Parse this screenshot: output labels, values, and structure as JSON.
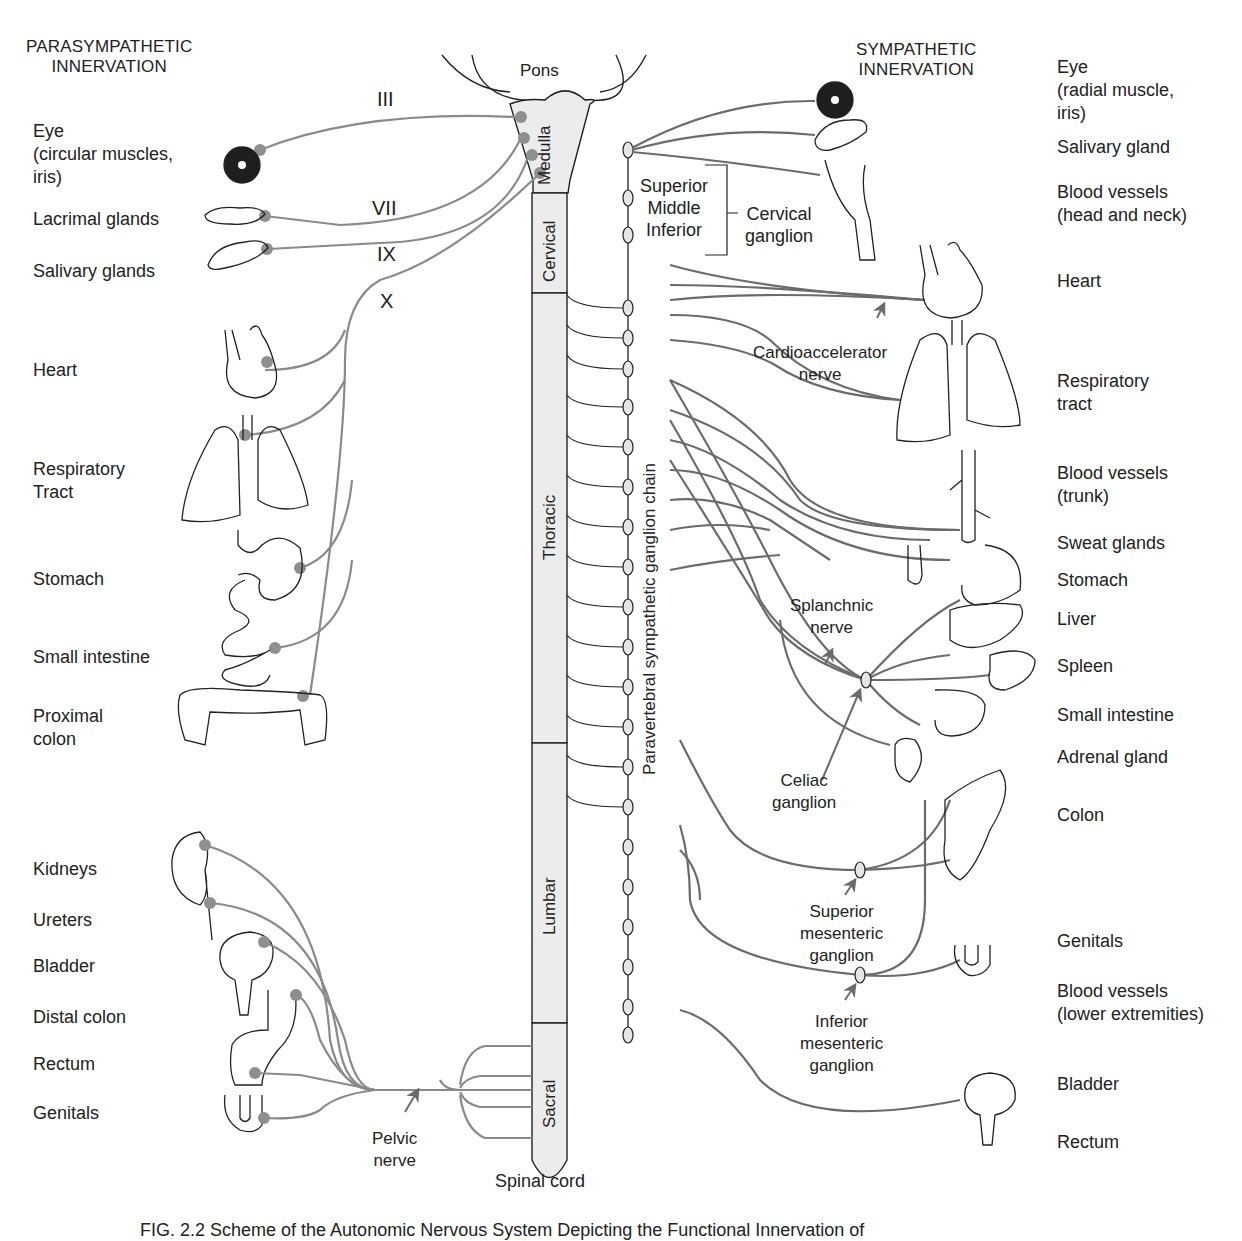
{
  "headers": {
    "parasympathetic": [
      "PARASYMPATHETIC",
      "INNERVATION"
    ],
    "sympathetic": [
      "SYMPATHETIC",
      "INNERVATION"
    ]
  },
  "brainstem": {
    "pons": "Pons",
    "medulla": "Medulla"
  },
  "spinal_cord": {
    "label": "Spinal cord",
    "segments": [
      "Cervical",
      "Thoracic",
      "Lumbar",
      "Sacral"
    ]
  },
  "cranial_nerves": [
    "III",
    "VII",
    "IX",
    "X"
  ],
  "parasympathetic_targets": [
    {
      "lines": [
        "Eye",
        "(circular muscles,",
        "iris)"
      ]
    },
    {
      "lines": [
        "Lacrimal glands"
      ]
    },
    {
      "lines": [
        "Salivary glands"
      ]
    },
    {
      "lines": [
        "Heart"
      ]
    },
    {
      "lines": [
        "Respiratory",
        "Tract"
      ]
    },
    {
      "lines": [
        "Stomach"
      ]
    },
    {
      "lines": [
        "Small intestine"
      ]
    },
    {
      "lines": [
        "Proximal",
        "colon"
      ]
    },
    {
      "lines": [
        "Kidneys"
      ]
    },
    {
      "lines": [
        "Ureters"
      ]
    },
    {
      "lines": [
        "Bladder"
      ]
    },
    {
      "lines": [
        "Distal colon"
      ]
    },
    {
      "lines": [
        "Rectum"
      ]
    },
    {
      "lines": [
        "Genitals"
      ]
    }
  ],
  "sympathetic_targets": [
    {
      "lines": [
        "Eye",
        "(radial muscle,",
        "iris)"
      ]
    },
    {
      "lines": [
        "Salivary gland"
      ]
    },
    {
      "lines": [
        "Blood vessels",
        "(head and neck)"
      ]
    },
    {
      "lines": [
        "Heart"
      ]
    },
    {
      "lines": [
        "Respiratory",
        "tract"
      ]
    },
    {
      "lines": [
        "Blood vessels",
        "(trunk)"
      ]
    },
    {
      "lines": [
        "Sweat glands"
      ]
    },
    {
      "lines": [
        "Stomach"
      ]
    },
    {
      "lines": [
        "Liver"
      ]
    },
    {
      "lines": [
        "Spleen"
      ]
    },
    {
      "lines": [
        "Small intestine"
      ]
    },
    {
      "lines": [
        "Adrenal gland"
      ]
    },
    {
      "lines": [
        "Colon"
      ]
    },
    {
      "lines": [
        "Genitals"
      ]
    },
    {
      "lines": [
        "Blood vessels",
        "(lower extremities)"
      ]
    },
    {
      "lines": [
        "Bladder"
      ]
    },
    {
      "lines": [
        "Rectum"
      ]
    }
  ],
  "ganglia_labels": {
    "cervical_levels": [
      "Superior",
      "Middle",
      "Inferior"
    ],
    "cervical_ganglion": [
      "Cervical",
      "ganglion"
    ],
    "cardioaccelerator": [
      "Cardioaccelerator",
      "nerve"
    ],
    "splanchnic": [
      "Splanchnic",
      "nerve"
    ],
    "celiac": [
      "Celiac",
      "ganglion"
    ],
    "superior_mesenteric": [
      "Superior",
      "mesenteric",
      "ganglion"
    ],
    "inferior_mesenteric": [
      "Inferior",
      "mesenteric",
      "ganglion"
    ],
    "chain": "Paravertebral sympathetic ganglion chain",
    "pelvic": [
      "Pelvic",
      "nerve"
    ]
  },
  "caption": "FIG. 2.2 Scheme of the Autonomic Nervous System Depicting the Functional Innervation of",
  "colors": {
    "nerve": "#8a8a8a",
    "nerve_dark": "#6b6b6b",
    "node": "#8f8f8f",
    "cord_fill": "#ededed",
    "outline": "#222222"
  }
}
